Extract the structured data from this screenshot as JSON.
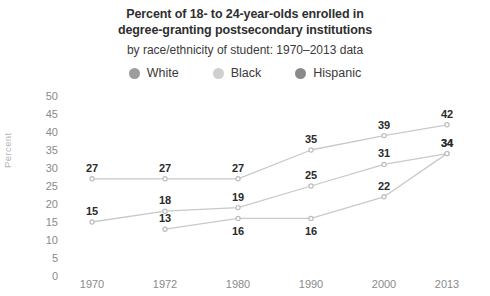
{
  "header": {
    "title_line1": "Percent of 18- to 24-year-olds enrolled in",
    "title_line2": "degree-granting postsecondary institutions",
    "subtitle": "by race/ethnicity of student: 1970–2013 data"
  },
  "legend": {
    "items": [
      {
        "label": "White",
        "color": "#9d9d9d"
      },
      {
        "label": "Black",
        "color": "#cfcfcf"
      },
      {
        "label": "Hispanic",
        "color": "#8a8a8a"
      }
    ]
  },
  "colors": {
    "line": "#c9c9c9",
    "marker": "#bdbdbd",
    "label_text": "#2b2b2b",
    "tick_text": "#8a8a8a",
    "axis_title": "#b5b5b5",
    "background": "#ffffff"
  },
  "chart_data": {
    "type": "line",
    "title": "Percent of 18- to 24-year-olds enrolled in degree-granting postsecondary institutions",
    "subtitle": "by race/ethnicity of student: 1970–2013 data",
    "xlabel": "",
    "ylabel": "Percent",
    "categories": [
      "1970",
      "1972",
      "1980",
      "1990",
      "2000",
      "2013"
    ],
    "ylim": [
      0,
      50
    ],
    "yticks": [
      0,
      5,
      10,
      15,
      20,
      25,
      30,
      35,
      40,
      45,
      50
    ],
    "grid": false,
    "legend_position": "top",
    "series": [
      {
        "name": "White",
        "values": [
          27,
          27,
          27,
          35,
          39,
          42
        ],
        "label_positions": [
          "above",
          "above",
          "above",
          "above",
          "above",
          "above"
        ]
      },
      {
        "name": "Black",
        "values": [
          15,
          18,
          19,
          25,
          31,
          34
        ],
        "label_positions": [
          "above",
          "above",
          "above",
          "above",
          "above",
          "above"
        ]
      },
      {
        "name": "Hispanic",
        "values": [
          null,
          13,
          16,
          16,
          22,
          34
        ],
        "label_positions": [
          null,
          "above",
          "below",
          "below",
          "above",
          "above"
        ]
      }
    ]
  }
}
